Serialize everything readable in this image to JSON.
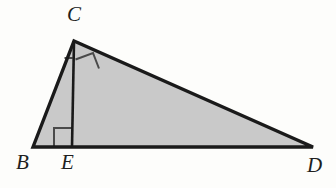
{
  "figure": {
    "kind": "geometry-diagram",
    "background_color": "#fdfdfb",
    "fill_color": "#c9c9c9",
    "stroke_color": "#1a1a1a",
    "mark_color": "#4a4a4a"
  },
  "labels": {
    "C": "C",
    "B": "B",
    "E": "E",
    "D": "D"
  },
  "points": {
    "B": {
      "x": 33,
      "y": 147
    },
    "C": {
      "x": 74,
      "y": 41
    },
    "E": {
      "x": 72,
      "y": 147
    },
    "D": {
      "x": 313,
      "y": 147
    }
  },
  "segments": [
    {
      "name": "BC",
      "from": "B",
      "to": "C",
      "width": 3.4
    },
    {
      "name": "CD",
      "from": "C",
      "to": "D",
      "width": 3.4
    },
    {
      "name": "BD",
      "from": "B",
      "to": "D",
      "width": 3.4
    },
    {
      "name": "CE",
      "from": "C",
      "to": "E",
      "width": 2.6
    }
  ],
  "angle_marks": [
    {
      "name": "right-angle-at-E",
      "vertex": "E",
      "type": "square",
      "size": 18
    },
    {
      "name": "right-angle-at-C",
      "vertex": "C",
      "type": "square",
      "size": 17
    },
    {
      "name": "angle-tick-BCE",
      "vertex": "C",
      "type": "tick",
      "size": 9
    }
  ]
}
